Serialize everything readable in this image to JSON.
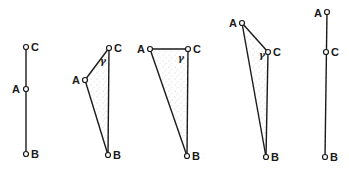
{
  "diagram": {
    "angle_label": "γ",
    "figures": [
      {
        "id": "fig1",
        "type": "collinear",
        "points": {
          "A": [
            26,
            89
          ],
          "B": [
            26,
            154
          ],
          "C": [
            26,
            47
          ]
        },
        "labels": {
          "A": "A",
          "B": "B",
          "C": "C"
        }
      },
      {
        "id": "fig2",
        "type": "triangle",
        "points": {
          "A": [
            85,
            80
          ],
          "B": [
            108,
            155
          ],
          "C": [
            109,
            48
          ]
        },
        "labels": {
          "A": "A",
          "B": "B",
          "C": "C"
        },
        "angle": "γ"
      },
      {
        "id": "fig3",
        "type": "triangle",
        "points": {
          "A": [
            150,
            49
          ],
          "B": [
            187,
            156
          ],
          "C": [
            188,
            49
          ]
        },
        "labels": {
          "A": "A",
          "B": "B",
          "C": "C"
        },
        "angle": "γ"
      },
      {
        "id": "fig4",
        "type": "triangle",
        "points": {
          "A": [
            242,
            23
          ],
          "B": [
            266,
            157
          ],
          "C": [
            268,
            52
          ]
        },
        "labels": {
          "A": "A",
          "B": "B",
          "C": "C"
        },
        "angle": "γ"
      },
      {
        "id": "fig5",
        "type": "collinear",
        "points": {
          "A": [
            327,
            12
          ],
          "B": [
            325,
            157
          ],
          "C": [
            326,
            52
          ]
        },
        "labels": {
          "A": "A",
          "B": "B",
          "C": "C"
        }
      }
    ]
  }
}
